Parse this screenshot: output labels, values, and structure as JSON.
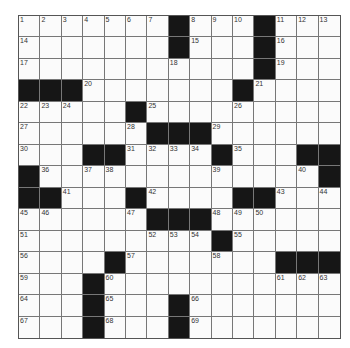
{
  "puzzle": {
    "rows": 15,
    "cols": 15,
    "layout": [
      "....... ...#...",
      "",
      "",
      "",
      "",
      "",
      "",
      "",
      "",
      "",
      "",
      "",
      "",
      "",
      ""
    ],
    "grid": [
      ".......#...#...",
      ".......#...#...",
      "...........#...",
      "###.......#....",
      ".....#.........",
      "......###......",
      "...##....#...##",
      "#.............#",
      "##...#....##...",
      "......###......",
      ".........#.....",
      "....#.......###",
      "...#...........",
      "...#...#.......",
      "...#...#......."
    ],
    "numbers": [
      {
        "r": 0,
        "c": 0,
        "n": "1"
      },
      {
        "r": 0,
        "c": 1,
        "n": "2"
      },
      {
        "r": 0,
        "c": 2,
        "n": "3"
      },
      {
        "r": 0,
        "c": 3,
        "n": "4"
      },
      {
        "r": 0,
        "c": 4,
        "n": "5"
      },
      {
        "r": 0,
        "c": 5,
        "n": "6"
      },
      {
        "r": 0,
        "c": 6,
        "n": "7"
      },
      {
        "r": 0,
        "c": 8,
        "n": "8"
      },
      {
        "r": 0,
        "c": 9,
        "n": "9"
      },
      {
        "r": 0,
        "c": 10,
        "n": "10"
      },
      {
        "r": 0,
        "c": 12,
        "n": "11"
      },
      {
        "r": 0,
        "c": 13,
        "n": "12"
      },
      {
        "r": 0,
        "c": 14,
        "n": "13"
      },
      {
        "r": 1,
        "c": 0,
        "n": "14"
      },
      {
        "r": 1,
        "c": 8,
        "n": "15"
      },
      {
        "r": 1,
        "c": 12,
        "n": "16"
      },
      {
        "r": 2,
        "c": 0,
        "n": "17"
      },
      {
        "r": 2,
        "c": 7,
        "n": "18"
      },
      {
        "r": 2,
        "c": 12,
        "n": "19"
      },
      {
        "r": 3,
        "c": 3,
        "n": "20"
      },
      {
        "r": 3,
        "c": 11,
        "n": "21"
      },
      {
        "r": 4,
        "c": 0,
        "n": "22"
      },
      {
        "r": 4,
        "c": 1,
        "n": "23"
      },
      {
        "r": 4,
        "c": 2,
        "n": "24"
      },
      {
        "r": 4,
        "c": 6,
        "n": "25"
      },
      {
        "r": 4,
        "c": 10,
        "n": "26"
      },
      {
        "r": 5,
        "c": 0,
        "n": "27"
      },
      {
        "r": 5,
        "c": 5,
        "n": "28"
      },
      {
        "r": 5,
        "c": 9,
        "n": "29"
      },
      {
        "r": 6,
        "c": 0,
        "n": "30"
      },
      {
        "r": 6,
        "c": 5,
        "n": "31"
      },
      {
        "r": 6,
        "c": 6,
        "n": "32"
      },
      {
        "r": 6,
        "c": 7,
        "n": "33"
      },
      {
        "r": 6,
        "c": 8,
        "n": "34"
      },
      {
        "r": 6,
        "c": 10,
        "n": "35"
      },
      {
        "r": 7,
        "c": 1,
        "n": "36"
      },
      {
        "r": 7,
        "c": 3,
        "n": "37"
      },
      {
        "r": 7,
        "c": 4,
        "n": "38"
      },
      {
        "r": 7,
        "c": 9,
        "n": "39"
      },
      {
        "r": 7,
        "c": 13,
        "n": "40"
      },
      {
        "r": 8,
        "c": 2,
        "n": "41"
      },
      {
        "r": 8,
        "c": 6,
        "n": "42"
      },
      {
        "r": 8,
        "c": 12,
        "n": "43"
      },
      {
        "r": 8,
        "c": 14,
        "n": "44"
      },
      {
        "r": 9,
        "c": 0,
        "n": "45"
      },
      {
        "r": 9,
        "c": 1,
        "n": "46"
      },
      {
        "r": 9,
        "c": 5,
        "n": "47"
      },
      {
        "r": 9,
        "c": 9,
        "n": "48"
      },
      {
        "r": 9,
        "c": 10,
        "n": "49"
      },
      {
        "r": 9,
        "c": 11,
        "n": "50"
      },
      {
        "r": 10,
        "c": 0,
        "n": "51"
      },
      {
        "r": 10,
        "c": 6,
        "n": "52"
      },
      {
        "r": 10,
        "c": 7,
        "n": "53"
      },
      {
        "r": 10,
        "c": 8,
        "n": "54"
      },
      {
        "r": 10,
        "c": 10,
        "n": "55"
      },
      {
        "r": 11,
        "c": 0,
        "n": "56"
      },
      {
        "r": 11,
        "c": 5,
        "n": "57"
      },
      {
        "r": 11,
        "c": 9,
        "n": "58"
      },
      {
        "r": 12,
        "c": 0,
        "n": "59"
      },
      {
        "r": 12,
        "c": 4,
        "n": "60"
      },
      {
        "r": 12,
        "c": 12,
        "n": "61"
      },
      {
        "r": 12,
        "c": 13,
        "n": "62"
      },
      {
        "r": 12,
        "c": 14,
        "n": "63"
      },
      {
        "r": 13,
        "c": 0,
        "n": "64"
      },
      {
        "r": 13,
        "c": 4,
        "n": "65"
      },
      {
        "r": 13,
        "c": 8,
        "n": "66"
      },
      {
        "r": 14,
        "c": 0,
        "n": "67"
      },
      {
        "r": 14,
        "c": 4,
        "n": "68"
      },
      {
        "r": 14,
        "c": 8,
        "n": "69"
      }
    ],
    "letters": []
  },
  "colors": {
    "black_square": "#161616",
    "grid_line": "#777777",
    "cell_background": "#fbfbfb",
    "number_text": "#333333"
  }
}
